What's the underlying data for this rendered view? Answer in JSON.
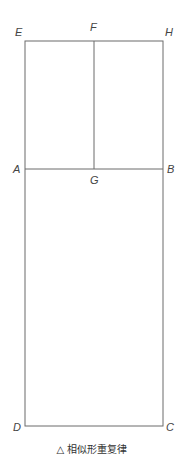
{
  "diagram": {
    "points": {
      "E": {
        "label": "E",
        "x": 25,
        "y": 41
      },
      "F": {
        "label": "F",
        "x": 94,
        "y": 41
      },
      "H": {
        "label": "H",
        "x": 163,
        "y": 41
      },
      "A": {
        "label": "A",
        "x": 25,
        "y": 169
      },
      "G": {
        "label": "G",
        "x": 94,
        "y": 169
      },
      "B": {
        "label": "B",
        "x": 163,
        "y": 169
      },
      "D": {
        "label": "D",
        "x": 25,
        "y": 426
      },
      "C": {
        "label": "C",
        "x": 163,
        "y": 426
      }
    },
    "line_color": "#6b6b6b",
    "caption": "△ 相似形重复律"
  }
}
